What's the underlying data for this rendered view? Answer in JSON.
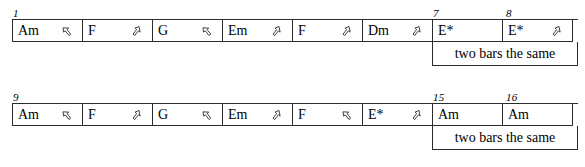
{
  "document": {
    "kind": "chord-chart",
    "ink_color": "#2b2b2b",
    "paper_color": "#ffffff"
  },
  "systems": [
    {
      "name": "system-bars-1-8",
      "bar_numbers": [
        {
          "label": "1",
          "cell_index": 0
        },
        {
          "label": "7",
          "cell_index": 6
        },
        {
          "label": "8",
          "cell_index": 7
        }
      ],
      "cells": [
        {
          "chord": "Am",
          "strum": "up-left-arrow-icon"
        },
        {
          "chord": "F",
          "strum": "up-right-arrow-icon"
        },
        {
          "chord": "G",
          "strum": "up-left-arrow-icon"
        },
        {
          "chord": "Em",
          "strum": "up-right-arrow-icon"
        },
        {
          "chord": "F",
          "strum": "up-right-arrow-icon"
        },
        {
          "chord": "Dm",
          "strum": "up-right-arrow-icon"
        },
        {
          "chord": "E*",
          "strum": "none"
        },
        {
          "chord": "E*",
          "strum": "up-right-arrow-icon"
        }
      ],
      "annotation": "two bars the same"
    },
    {
      "name": "system-bars-9-16",
      "bar_numbers": [
        {
          "label": "9",
          "cell_index": 0
        },
        {
          "label": "15",
          "cell_index": 6
        },
        {
          "label": "16",
          "cell_index": 7
        }
      ],
      "cells": [
        {
          "chord": "Am",
          "strum": "up-left-arrow-icon"
        },
        {
          "chord": "F",
          "strum": "up-right-arrow-icon"
        },
        {
          "chord": "G",
          "strum": "up-left-arrow-icon"
        },
        {
          "chord": "Em",
          "strum": "up-right-arrow-icon"
        },
        {
          "chord": "F",
          "strum": "up-left-arrow-icon"
        },
        {
          "chord": "E*",
          "strum": "up-right-arrow-icon"
        },
        {
          "chord": "Am",
          "strum": "none"
        },
        {
          "chord": "Am",
          "strum": "none"
        }
      ],
      "annotation": "two bars the same"
    }
  ]
}
